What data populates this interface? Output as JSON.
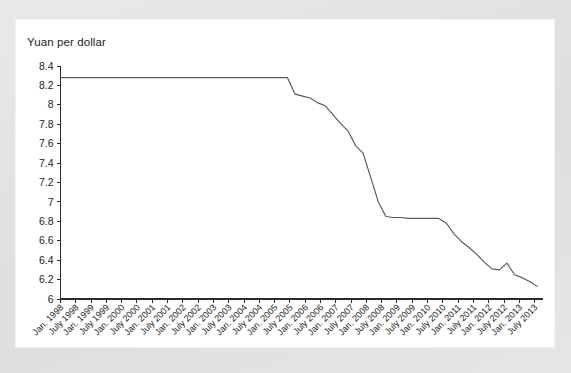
{
  "card": {
    "title": "Yuan per dollar",
    "background_color": "#ffffff",
    "frame_color": "#e3e3e3"
  },
  "chart_data": {
    "type": "line",
    "title": "Yuan per dollar",
    "xlabel": "",
    "ylabel": "Yuan per dollar",
    "ylim": [
      6.0,
      8.4
    ],
    "ytick_labels": [
      "8.4",
      "8.2",
      "8",
      "7.8",
      "7.6",
      "7.4",
      "7.2",
      "7",
      "6.8",
      "6.6",
      "6.4",
      "6.2",
      "6"
    ],
    "ytick_values": [
      8.4,
      8.2,
      8.0,
      7.8,
      7.6,
      7.4,
      7.2,
      7.0,
      6.8,
      6.6,
      6.4,
      6.2,
      6.0
    ],
    "grid": false,
    "legend": "none",
    "line_color": "#58585a",
    "xtick_labels": [
      "Jan. 1998",
      "July 1998",
      "Jan. 1999",
      "July 1999",
      "Jan. 2000",
      "July 2000",
      "Jan. 2001",
      "July 2001",
      "Jan. 2002",
      "July 2002",
      "Jan. 2003",
      "July 2003",
      "Jan. 2004",
      "July 2004",
      "Jan. 2005",
      "July 2005",
      "Jan. 2006",
      "July 2006",
      "Jan. 2007",
      "July 2007",
      "Jan. 2008",
      "July 2008",
      "Jan. 2009",
      "July 2009",
      "Jan. 2010",
      "July 2010",
      "Jan. 2011",
      "July 2011",
      "Jan. 2012",
      "July 2012",
      "Jan. 2013",
      "July 2013"
    ],
    "series": [
      {
        "name": "Yuan per dollar",
        "x": [
          "Jan. 1998",
          "Apr. 1998",
          "July 1998",
          "Oct. 1998",
          "Jan. 1999",
          "Apr. 1999",
          "July 1999",
          "Oct. 1999",
          "Jan. 2000",
          "Apr. 2000",
          "July 2000",
          "Oct. 2000",
          "Jan. 2001",
          "Apr. 2001",
          "July 2001",
          "Oct. 2001",
          "Jan. 2002",
          "Apr. 2002",
          "July 2002",
          "Oct. 2002",
          "Jan. 2003",
          "Apr. 2003",
          "July 2003",
          "Oct. 2003",
          "Jan. 2004",
          "Apr. 2004",
          "July 2004",
          "Oct. 2004",
          "Jan. 2005",
          "Apr. 2005",
          "July 2005",
          "Aug. 2005",
          "Oct. 2005",
          "Jan. 2006",
          "Apr. 2006",
          "July 2006",
          "Oct. 2006",
          "Jan. 2007",
          "Apr. 2007",
          "July 2007",
          "Oct. 2007",
          "Jan. 2008",
          "Apr. 2008",
          "July 2008",
          "Oct. 2008",
          "Jan. 2009",
          "Apr. 2009",
          "July 2009",
          "Oct. 2009",
          "Jan. 2010",
          "Apr. 2010",
          "July 2010",
          "Oct. 2010",
          "Jan. 2011",
          "Apr. 2011",
          "July 2011",
          "Oct. 2011",
          "Jan. 2012",
          "Apr. 2012",
          "July 2012",
          "Oct. 2012",
          "Jan. 2013",
          "Apr. 2013",
          "July 2013"
        ],
        "values": [
          8.28,
          8.28,
          8.28,
          8.28,
          8.28,
          8.28,
          8.28,
          8.28,
          8.28,
          8.28,
          8.28,
          8.28,
          8.28,
          8.28,
          8.28,
          8.28,
          8.28,
          8.28,
          8.28,
          8.28,
          8.28,
          8.28,
          8.28,
          8.28,
          8.28,
          8.28,
          8.28,
          8.28,
          8.28,
          8.28,
          8.28,
          8.11,
          8.09,
          8.07,
          8.02,
          7.99,
          7.9,
          7.81,
          7.73,
          7.58,
          7.5,
          7.25,
          7.0,
          6.85,
          6.84,
          6.84,
          6.83,
          6.83,
          6.83,
          6.83,
          6.83,
          6.78,
          6.67,
          6.59,
          6.53,
          6.46,
          6.38,
          6.31,
          6.3,
          6.37,
          6.25,
          6.22,
          6.18,
          6.13
        ]
      }
    ],
    "annotations": {
      "peg_value": 8.28,
      "peg_end": "July 2005",
      "plateau_value": 6.83,
      "final_value": 6.13
    }
  }
}
